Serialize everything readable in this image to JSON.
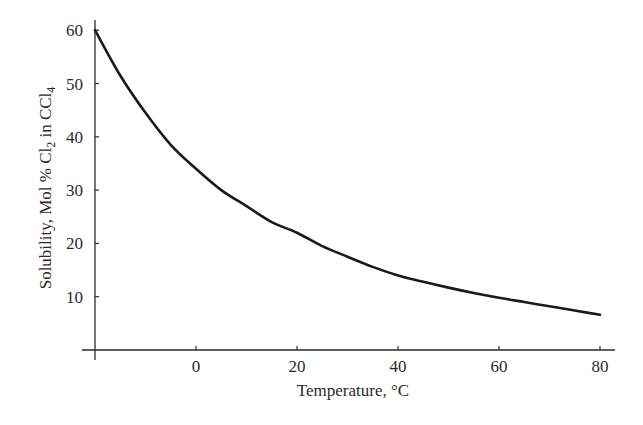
{
  "chart_data": {
    "type": "line",
    "title": "",
    "xlabel": "Temperature, °C",
    "ylabel": "Solubility, Mol % Cl2 in CCl4",
    "ylabel_parts": {
      "prefix": "Solubility,  Mol % Cl",
      "sub1": "2",
      "mid": " in CCl",
      "sub2": "4"
    },
    "xlim": [
      -20,
      82
    ],
    "ylim": [
      0,
      62
    ],
    "x_ticks": [
      0,
      20,
      40,
      60,
      80
    ],
    "x_tick_labels": [
      "0",
      "20",
      "40",
      "60",
      "80"
    ],
    "y_ticks": [
      10,
      20,
      30,
      40,
      50,
      60
    ],
    "y_tick_labels": [
      "10",
      "20",
      "30",
      "40",
      "50",
      "60"
    ],
    "grid": false,
    "legend": null,
    "series": [
      {
        "name": "Cl2 solubility in CCl4",
        "color": "#1a1a1a",
        "x": [
          -20,
          -15,
          -10,
          -5,
          0,
          5,
          10,
          15,
          20,
          25,
          30,
          35,
          40,
          45,
          50,
          55,
          60,
          65,
          70,
          75,
          80
        ],
        "y": [
          60,
          51.5,
          44.5,
          38.5,
          34,
          30,
          27,
          24,
          22,
          19.5,
          17.5,
          15.6,
          14,
          12.8,
          11.7,
          10.7,
          9.8,
          9.0,
          8.2,
          7.4,
          6.6
        ]
      }
    ]
  }
}
